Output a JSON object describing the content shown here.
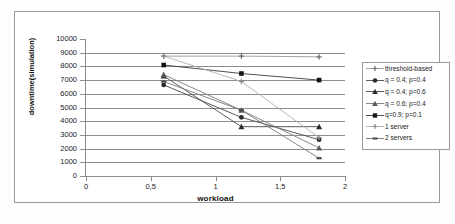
{
  "chart_data": {
    "type": "line",
    "title": "",
    "xlabel": "workload",
    "ylabel": "downtime(simulation)",
    "x": [
      0.6,
      1.2,
      1.8
    ],
    "xlim": [
      0,
      2
    ],
    "ylim": [
      0,
      10000
    ],
    "grid": true,
    "legend_position": "right",
    "x_ticks": [
      "0",
      "0,5",
      "1",
      "1,5",
      "2"
    ],
    "x_tick_values": [
      0,
      0.5,
      1,
      1.5,
      2
    ],
    "y_ticks": [
      "0",
      "1000",
      "2000",
      "3000",
      "4000",
      "5000",
      "6000",
      "7000",
      "8000",
      "9000",
      "10000"
    ],
    "y_tick_values": [
      0,
      1000,
      2000,
      3000,
      4000,
      5000,
      6000,
      7000,
      8000,
      9000,
      10000
    ],
    "series": [
      {
        "name": "threshold-based",
        "marker": "plus",
        "color": "#6f6f6f",
        "line_color": "#9a9a9a",
        "values": [
          8750,
          8750,
          8700
        ]
      },
      {
        "name": "q = 0.4; p=0.4",
        "marker": "circle",
        "color": "#2b2b2b",
        "line_color": "#4a4a4a",
        "values": [
          6650,
          4280,
          2650
        ]
      },
      {
        "name": "q = 0.4; p=0.6",
        "marker": "triangle",
        "color": "#2b2b2b",
        "line_color": "#4a4a4a",
        "values": [
          7300,
          3600,
          3600
        ]
      },
      {
        "name": "q = 0.6; p=0.4",
        "marker": "triangle",
        "color": "#5a5a5a",
        "line_color": "#7a7a7a",
        "values": [
          7400,
          4800,
          2050
        ]
      },
      {
        "name": "q=0.9; p=0.1",
        "marker": "square",
        "color": "#121212",
        "line_color": "#3a3a3a",
        "values": [
          8100,
          7480,
          7000
        ]
      },
      {
        "name": "1 server",
        "marker": "plus",
        "color": "#8a8a8a",
        "line_color": "#b0b0b0",
        "values": [
          8750,
          6900,
          2800
        ]
      },
      {
        "name": "2 servers",
        "marker": "dash",
        "color": "#4a4a4a",
        "line_color": "#7a7a7a",
        "values": [
          6900,
          4800,
          1300
        ]
      }
    ]
  }
}
